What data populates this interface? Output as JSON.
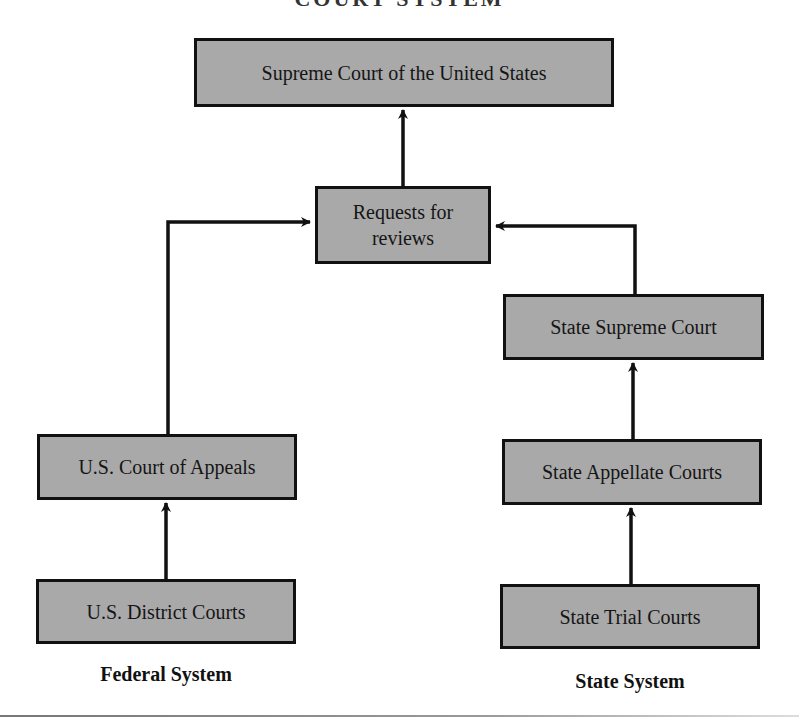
{
  "title_partial": "COURT SYSTEM",
  "nodes": {
    "supreme_court": "Supreme Court of the United States",
    "requests": "Requests for reviews",
    "state_supreme": "State Supreme Court",
    "state_appellate": "State Appellate Courts",
    "state_trial": "State Trial Courts",
    "us_appeals": "U.S. Court of Appeals",
    "us_district": "U.S. District Courts"
  },
  "labels": {
    "federal": "Federal System",
    "state": "State System"
  },
  "colors": {
    "box_fill": "#a9a9a9",
    "box_border": "#111111",
    "arrow": "#111111"
  },
  "edges": [
    {
      "from": "us_district",
      "to": "us_appeals"
    },
    {
      "from": "us_appeals",
      "to": "requests"
    },
    {
      "from": "state_trial",
      "to": "state_appellate"
    },
    {
      "from": "state_appellate",
      "to": "state_supreme"
    },
    {
      "from": "state_supreme",
      "to": "requests"
    },
    {
      "from": "requests",
      "to": "supreme_court"
    }
  ]
}
